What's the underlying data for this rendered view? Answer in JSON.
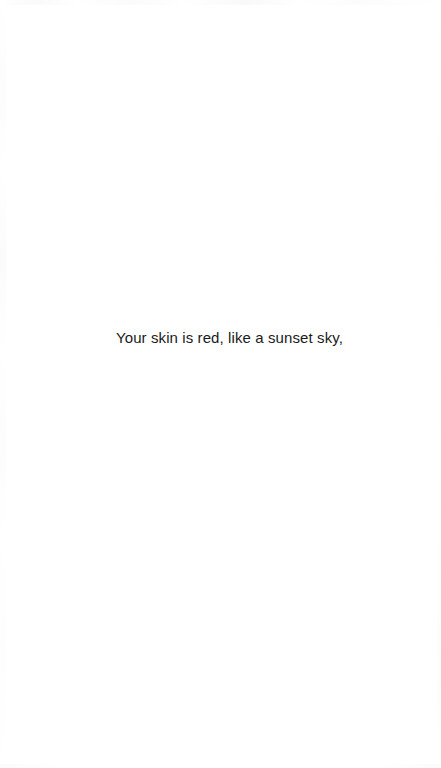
{
  "page": {
    "background_color": "#ffffff",
    "width": 441,
    "height": 768
  },
  "content": {
    "line": "Your skin is red, like a sunset sky,",
    "text_color": "#1a1a1a"
  }
}
